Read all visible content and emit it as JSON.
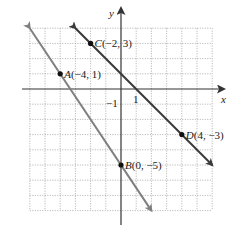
{
  "diagram": {
    "type": "coordinate-plane",
    "origin_px": [
      121,
      89
    ],
    "unit_px": 15.2,
    "grid": {
      "xmin": -6,
      "xmax": 6,
      "ymin": -8,
      "ymax": 4,
      "style": "dotted",
      "color": "#9a9a9a"
    },
    "axes": {
      "x_label": "x",
      "y_label": "y",
      "x_tick_label": "1",
      "y_tick_label": "−1",
      "color": "#333333"
    },
    "points": [
      {
        "id": "A",
        "label": "A(−4, 1)",
        "x": -4,
        "y": 1
      },
      {
        "id": "B",
        "label": "B(0, −5)",
        "x": 0,
        "y": -5
      },
      {
        "id": "C",
        "label": "C(−2, 3)",
        "x": -2,
        "y": 3
      },
      {
        "id": "D",
        "label": "D(4, −3)",
        "x": 4,
        "y": -3
      }
    ],
    "lines": [
      {
        "name": "line-AB",
        "through": [
          "A",
          "B"
        ],
        "slope": -1.5,
        "from": [
          -6,
          4
        ],
        "to": [
          2,
          -8
        ],
        "color": "#808080"
      },
      {
        "name": "line-CD",
        "through": [
          "C",
          "D"
        ],
        "slope": -1,
        "from": [
          -3,
          4
        ],
        "to": [
          6,
          -5
        ],
        "color": "#3a3a3a"
      }
    ]
  }
}
